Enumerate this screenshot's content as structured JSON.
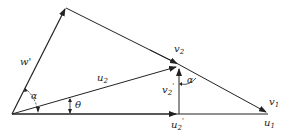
{
  "diagram": {
    "type": "velocity vector triangle",
    "labels": {
      "w_prime": "w'",
      "u2": "u",
      "u2_sub": "2",
      "theta": "θ",
      "alpha_left": "α",
      "v2": "v",
      "v2_sub": "2",
      "v2_prime": "v",
      "v2_prime_sub": "2",
      "v2_prime_mark": "'",
      "alpha_right": "α",
      "v1": "v",
      "v1_sub": "1",
      "u1": "u",
      "u1_sub": "1",
      "u2_prime": "u",
      "u2_prime_sub": "2",
      "u2_prime_mark": "'"
    },
    "colors": {
      "line": "#222222",
      "background": "#ffffff"
    }
  }
}
